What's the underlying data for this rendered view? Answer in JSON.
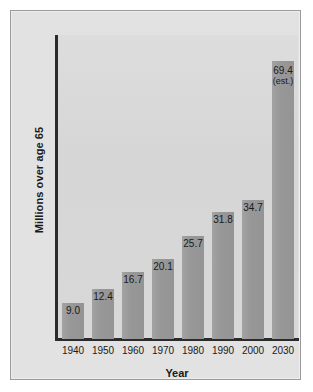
{
  "chart_data": {
    "type": "bar",
    "title": "",
    "subtitle": "",
    "xlabel": "Year",
    "ylabel": "Millions over age 65",
    "categories": [
      "1940",
      "1950",
      "1960",
      "1970",
      "1980",
      "1990",
      "2000",
      "2030"
    ],
    "values": [
      9.0,
      12.4,
      16.7,
      20.1,
      25.7,
      31.8,
      34.7,
      69.4
    ],
    "value_labels": [
      "9.0",
      "12.4",
      "16.7",
      "20.1",
      "25.7",
      "31.8",
      "34.7",
      "69.4"
    ],
    "annotations": [
      {
        "category": "2030",
        "text": "(est.)",
        "note": "2030 value is an estimate"
      }
    ],
    "ylim": [
      0,
      76
    ],
    "xlim_categories": 8,
    "grid": false,
    "legend": false,
    "legend_position": "none",
    "axis_ticks_y_labeled": false,
    "series": [
      {
        "name": "Millions over age 65",
        "values": [
          9.0,
          12.4,
          16.7,
          20.1,
          25.7,
          31.8,
          34.7,
          69.4
        ]
      }
    ]
  },
  "colors": {
    "page_background": "#ffffff",
    "frame_background": "#e2e2e2",
    "frame_border": "#9a9a9a",
    "plot_background": "#d9d9d9",
    "bar_fill": "#9b9b9b",
    "axis_line": "#2b2b2b",
    "text": "#1a1a1a"
  },
  "axis": {
    "y_title": "Millions over age 65",
    "x_title": "Year"
  },
  "bars": [
    {
      "category": "1940",
      "value": 9.0,
      "label": "9.0",
      "est": ""
    },
    {
      "category": "1950",
      "value": 12.4,
      "label": "12.4",
      "est": ""
    },
    {
      "category": "1960",
      "value": 16.7,
      "label": "16.7",
      "est": ""
    },
    {
      "category": "1970",
      "value": 20.1,
      "label": "20.1",
      "est": ""
    },
    {
      "category": "1980",
      "value": 25.7,
      "label": "25.7",
      "est": ""
    },
    {
      "category": "1990",
      "value": 31.8,
      "label": "31.8",
      "est": ""
    },
    {
      "category": "2000",
      "value": 34.7,
      "label": "34.7",
      "est": ""
    },
    {
      "category": "2030",
      "value": 69.4,
      "label": "69.4",
      "est": "(est.)"
    }
  ]
}
